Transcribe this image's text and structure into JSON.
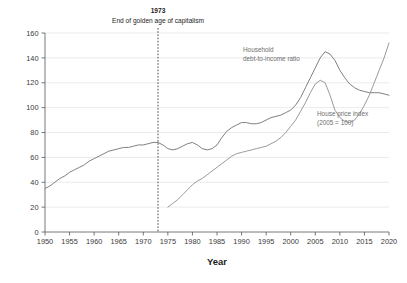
{
  "chart_data": {
    "type": "line",
    "title": "",
    "xlabel": "Year",
    "ylabel": "",
    "xlim": [
      1950,
      2020
    ],
    "ylim": [
      0,
      160
    ],
    "grid": true,
    "legend_position": "inline-annotation",
    "xticks": [
      1950,
      1955,
      1960,
      1965,
      1970,
      1975,
      1980,
      1985,
      1990,
      1995,
      2000,
      2005,
      2010,
      2015,
      2020
    ],
    "yticks": [
      0,
      20,
      40,
      60,
      80,
      100,
      120,
      140,
      160
    ],
    "annotations": [
      {
        "name": "event-1973",
        "year": 1973,
        "title": "1973",
        "subtitle": "End of golden age of capitalism",
        "style": "vertical-dashed-line"
      }
    ],
    "series": [
      {
        "name": "Household debt-to-income ratio",
        "label_line1": "Household",
        "label_line2": "debt-to-income ratio",
        "color": "#808080",
        "x": [
          1950,
          1951,
          1952,
          1953,
          1954,
          1955,
          1956,
          1957,
          1958,
          1959,
          1960,
          1961,
          1962,
          1963,
          1964,
          1965,
          1966,
          1967,
          1968,
          1969,
          1970,
          1971,
          1972,
          1973,
          1974,
          1975,
          1976,
          1977,
          1978,
          1979,
          1980,
          1981,
          1982,
          1983,
          1984,
          1985,
          1986,
          1987,
          1988,
          1989,
          1990,
          1991,
          1992,
          1993,
          1994,
          1995,
          1996,
          1997,
          1998,
          1999,
          2000,
          2001,
          2002,
          2003,
          2004,
          2005,
          2006,
          2007,
          2008,
          2009,
          2010,
          2011,
          2012,
          2013,
          2014,
          2015,
          2016,
          2017,
          2018,
          2019,
          2020
        ],
        "values": [
          35,
          37,
          40,
          43,
          45,
          48,
          50,
          52,
          54,
          57,
          59,
          61,
          63,
          65,
          66,
          67,
          68,
          68,
          69,
          70,
          70,
          71,
          72,
          72,
          70,
          67,
          66,
          67,
          69,
          71,
          72,
          70,
          67,
          66,
          67,
          70,
          76,
          81,
          84,
          86,
          88,
          88,
          87,
          87,
          88,
          90,
          92,
          93,
          94,
          96,
          98,
          102,
          108,
          116,
          124,
          132,
          140,
          145,
          143,
          138,
          130,
          124,
          119,
          116,
          114,
          113,
          112,
          112,
          112,
          111,
          110
        ]
      },
      {
        "name": "House price index (2005 = 100)",
        "label_line1": "House price index",
        "label_line2": "(2005 = 100)",
        "color": "#9a9a9a",
        "x": [
          1975,
          1976,
          1977,
          1978,
          1979,
          1980,
          1981,
          1982,
          1983,
          1984,
          1985,
          1986,
          1987,
          1988,
          1989,
          1990,
          1991,
          1992,
          1993,
          1994,
          1995,
          1996,
          1997,
          1998,
          1999,
          2000,
          2001,
          2002,
          2003,
          2004,
          2005,
          2006,
          2007,
          2008,
          2009,
          2010,
          2011,
          2012,
          2013,
          2014,
          2015,
          2016,
          2017,
          2018,
          2019,
          2020
        ],
        "values": [
          20,
          23,
          26,
          30,
          34,
          38,
          41,
          43,
          46,
          49,
          52,
          55,
          58,
          61,
          63,
          64,
          65,
          66,
          67,
          68,
          69,
          71,
          73,
          76,
          80,
          85,
          90,
          97,
          104,
          112,
          119,
          122,
          120,
          110,
          98,
          92,
          89,
          88,
          90,
          95,
          102,
          110,
          120,
          130,
          140,
          152
        ]
      }
    ]
  },
  "labels": {
    "year_axis": "Year",
    "event_year": "1973",
    "event_text": "End of golden age of capitalism",
    "series1_line1": "Household",
    "series1_line2": "debt-to-income ratio",
    "series2_line1": "House price index",
    "series2_line2": "(2005 = 100)"
  }
}
